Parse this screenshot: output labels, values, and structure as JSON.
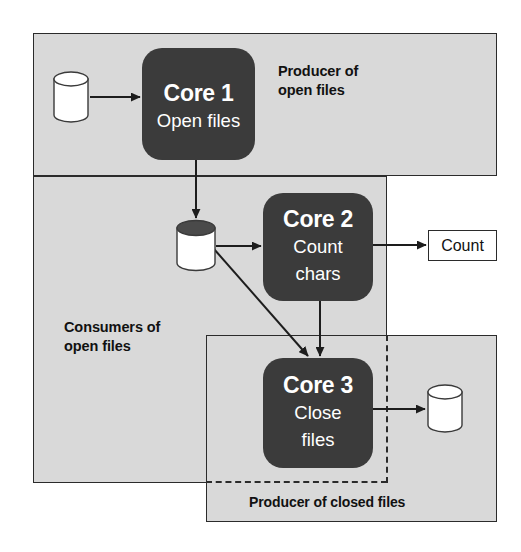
{
  "diagram": {
    "background_color": "#ffffff",
    "panel_fill": "#d9d9d9",
    "core_fill": "#3b3b3b",
    "stroke_color": "#2b2b2b",
    "core_text_color": "#ffffff"
  },
  "panels": [
    {
      "id": "producer-open",
      "label": "Producer of\nopen files",
      "style": "solid"
    },
    {
      "id": "consumers",
      "label": "Consumers of\nopen files",
      "style": "solid-with-dashed-overlap"
    },
    {
      "id": "producer-closed",
      "label": "Producer of closed files",
      "style": "solid"
    }
  ],
  "cores": [
    {
      "id": "core-1",
      "title": "Core 1",
      "subtitle": "Open files"
    },
    {
      "id": "core-2",
      "title": "Core 2",
      "subtitle": "Count\nchars"
    },
    {
      "id": "core-3",
      "title": "Core 3",
      "subtitle": "Close\nfiles"
    }
  ],
  "stores": [
    {
      "id": "cyl-input",
      "name": "input-files-store",
      "top_fill": "white"
    },
    {
      "id": "cyl-middle",
      "name": "open-files-queue",
      "top_fill": "dark"
    },
    {
      "id": "cyl-output",
      "name": "closed-files-store",
      "top_fill": "white"
    }
  ],
  "boxes": [
    {
      "id": "box-count",
      "label": "Count"
    }
  ],
  "connectors": [
    {
      "from": "cyl-input",
      "to": "core-1",
      "kind": "arrow",
      "direction": "right"
    },
    {
      "from": "core-1",
      "to": "cyl-middle",
      "kind": "arrow",
      "direction": "down"
    },
    {
      "from": "cyl-middle",
      "to": "core-2",
      "kind": "arrow",
      "direction": "right"
    },
    {
      "from": "cyl-middle",
      "to": "core-3",
      "kind": "arrow",
      "direction": "diagonal-down-right"
    },
    {
      "from": "core-2",
      "to": "box-count",
      "kind": "arrow",
      "direction": "right"
    },
    {
      "from": "core-2",
      "to": "core-3",
      "kind": "arrow",
      "direction": "down"
    },
    {
      "from": "core-3",
      "to": "cyl-output",
      "kind": "arrow",
      "direction": "right"
    }
  ]
}
